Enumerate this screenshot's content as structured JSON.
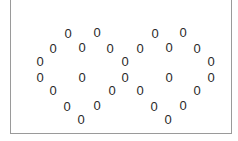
{
  "diagram": {
    "glyph": "0",
    "glyph_color": "#2a2a2a",
    "frame_color": "#9a9a9a",
    "hearts": [
      {
        "name": "left-heart",
        "points": [
          [
            68,
            34
          ],
          [
            97,
            33
          ],
          [
            53,
            49
          ],
          [
            82,
            48
          ],
          [
            110,
            49
          ],
          [
            40,
            62
          ],
          [
            125,
            62
          ],
          [
            40,
            78
          ],
          [
            82,
            78
          ],
          [
            125,
            78
          ],
          [
            53,
            91
          ],
          [
            112,
            91
          ],
          [
            67,
            107
          ],
          [
            97,
            106
          ],
          [
            81,
            120
          ]
        ]
      },
      {
        "name": "right-heart",
        "points": [
          [
            155,
            34
          ],
          [
            183,
            33
          ],
          [
            140,
            49
          ],
          [
            169,
            48
          ],
          [
            197,
            49
          ],
          [
            211,
            62
          ],
          [
            169,
            78
          ],
          [
            211,
            78
          ],
          [
            140,
            91
          ],
          [
            197,
            91
          ],
          [
            154,
            107
          ],
          [
            183,
            106
          ],
          [
            168,
            120
          ]
        ]
      }
    ]
  }
}
